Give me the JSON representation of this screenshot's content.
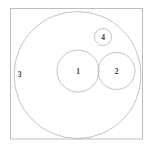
{
  "figure": {
    "kind": "euler-diagram",
    "background_color": "#ffffff",
    "stroke_color": "#a9a9ac",
    "frame_stroke_color": "#b8b8bb",
    "label_color": "#3a3a3a",
    "canvas": {
      "width": 153,
      "height": 148
    }
  },
  "frame": {
    "name": "universe-box",
    "x": 10.5,
    "y": 8.5,
    "width": 132,
    "height": 130.5
  },
  "sets": [
    {
      "label": "3",
      "name": "set-3-circle",
      "cx": 77.5,
      "cy": 75.0,
      "r": 63.5,
      "label_x": 19.5,
      "label_y": 74.0,
      "relation": "outer-enclosing-set"
    },
    {
      "label": "1",
      "name": "set-1-circle",
      "cx": 78.0,
      "cy": 71.0,
      "r": 21.0,
      "label_x": 78.0,
      "label_y": 71.5,
      "relation": "inside-set-3-tangent-to-set-2"
    },
    {
      "label": "2",
      "name": "set-2-circle",
      "cx": 116.5,
      "cy": 71.0,
      "r": 18.5,
      "label_x": 116.5,
      "label_y": 71.5,
      "relation": "inside-set-3-tangent-to-set-1"
    },
    {
      "label": "4",
      "name": "set-4-circle",
      "cx": 103.0,
      "cy": 37.0,
      "r": 8.5,
      "label_x": 103.0,
      "label_y": 37.5,
      "relation": "inside-set-3-disjoint-from-1-and-2"
    }
  ],
  "labels": {
    "set_1": "1",
    "set_2": "2",
    "set_3": "3",
    "set_4": "4"
  }
}
